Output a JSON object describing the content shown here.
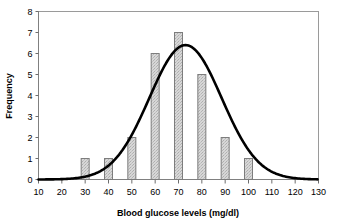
{
  "chart_data": {
    "type": "bar",
    "title": "",
    "xlabel": "Blood glucose levels (mg/dl)",
    "ylabel": "Frequency",
    "categories": [
      30,
      40,
      50,
      60,
      70,
      80,
      90,
      100
    ],
    "values": [
      1,
      1,
      2,
      6,
      7,
      5,
      2,
      1
    ],
    "bin_width": 10,
    "xlim": [
      10,
      130
    ],
    "ylim": [
      0,
      8
    ],
    "xticks": [
      10,
      20,
      30,
      40,
      50,
      60,
      70,
      80,
      90,
      100,
      110,
      120,
      130
    ],
    "yticks": [
      0,
      1,
      2,
      3,
      4,
      5,
      6,
      7,
      8
    ],
    "xtick_labels": [
      "10",
      "20",
      "30",
      "40",
      "50",
      "60",
      "70",
      "80",
      "90",
      "100",
      "110",
      "120",
      "130"
    ],
    "ytick_labels": [
      "0",
      "1",
      "2",
      "3",
      "4",
      "5",
      "6",
      "7",
      "8"
    ],
    "grid": false,
    "legend": null,
    "series": [
      {
        "name": "Frequency",
        "type": "bar",
        "values": [
          1,
          1,
          2,
          6,
          7,
          5,
          2,
          1
        ]
      },
      {
        "name": "Normal curve",
        "type": "line",
        "peak_x": 73,
        "peak_y": 6.4,
        "sigma": 15.5,
        "amplitude": 6.4
      }
    ],
    "colors": {
      "bar_fill": "#d2d2d2",
      "bar_edge": "#7d7d7d",
      "curve": "#000000",
      "axis": "#808080",
      "frame": "#9a9a9a",
      "text": "#000000"
    }
  },
  "axes": {
    "x_title": "Blood glucose levels (mg/dl)",
    "y_title": "Frequency"
  }
}
